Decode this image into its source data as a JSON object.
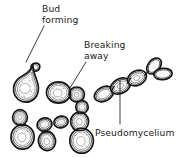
{
  "figure": {
    "background_color": "#ffffff",
    "ink_color": "#141414",
    "width": 181,
    "height": 158,
    "style": "hand-drawn line illustration, stippled cell interiors"
  },
  "labels": [
    {
      "id": "bud-forming",
      "line1": "Bud",
      "line2": "forming",
      "text_x": 42,
      "text_y": 12,
      "leader": "M 44 26 L 26 62",
      "points_to": "pear-shaped mother cell with small emerging bud, upper left"
    },
    {
      "id": "breaking-away",
      "line1": "Breaking",
      "line2": "away",
      "text_x": 84,
      "text_y": 48,
      "leader": "M 86 62 L 70 88",
      "points_to": "daughter cell detaching from mother cell, center"
    },
    {
      "id": "pseudomycelium",
      "line1": "Pseudomycelium",
      "line2": "",
      "text_x": 95,
      "text_y": 136,
      "leader": "M 120 124 L 120 80",
      "points_to": "chain of elongated attached cells, upper right"
    }
  ],
  "cell_groups": [
    {
      "id": "budding-mother-cell",
      "description": "Large pear-shaped cell with a small bud emerging at upper right",
      "position": {
        "x": 12,
        "y": 62
      },
      "cell_count": 2
    },
    {
      "id": "breaking-away-pair",
      "description": "Round mother cell with separating round daughter cell to its right",
      "position": {
        "x": 47,
        "y": 80
      },
      "cell_count": 2
    },
    {
      "id": "pseudomycelium-chain",
      "description": "Diagonal chain of four elongated cells with a branch at the upper right end",
      "position": {
        "x": 96,
        "y": 62
      },
      "cell_count": 5
    },
    {
      "id": "vertical-pair-left",
      "description": "Small cell atop a larger oval cell, lower left",
      "position": {
        "x": 10,
        "y": 108
      },
      "cell_count": 2
    },
    {
      "id": "small-cluster-center",
      "description": "Two small oval cells side by side above a single oval cell",
      "position": {
        "x": 38,
        "y": 115
      },
      "cell_count": 3
    },
    {
      "id": "triple-chain-center",
      "description": "Three cells in a vertical chain, smallest at top, largest at bottom",
      "position": {
        "x": 66,
        "y": 102
      },
      "cell_count": 3
    }
  ]
}
